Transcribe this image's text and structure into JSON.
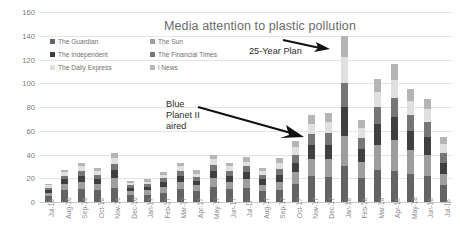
{
  "chart_data": {
    "type": "bar",
    "stacked": true,
    "title": "Media attention to plastic pollution",
    "xlabel": "",
    "ylabel": "",
    "ylim": [
      0,
      160
    ],
    "ytick_step": 20,
    "yticks": [
      0,
      20,
      40,
      60,
      80,
      100,
      120,
      140,
      160
    ],
    "grid": true,
    "legend_position": "top-left",
    "categories": [
      "Jul-16",
      "Aug-16",
      "Sep-16",
      "Oct-16",
      "Nov-16",
      "Dec-16",
      "Jan-17",
      "Feb-17",
      "Mar-17",
      "Apr-17",
      "May-17",
      "Jun-17",
      "Jul-17",
      "Aug-17",
      "Sep-17",
      "Oct-17",
      "Nov-17",
      "Dec-17",
      "Jan-18",
      "Feb-18",
      "Mar-18",
      "Apr-18",
      "May-18",
      "Jun-18",
      "Jul-18"
    ],
    "series": [
      {
        "name": "The Guardian",
        "color": "#636363",
        "values": [
          5,
          10,
          11,
          10,
          12,
          6,
          6,
          8,
          11,
          9,
          13,
          11,
          12,
          9,
          10,
          15,
          22,
          21,
          30,
          20,
          27,
          26,
          24,
          22,
          14
        ]
      },
      {
        "name": "The Sun",
        "color": "#9e9e9e",
        "values": [
          3,
          5,
          6,
          5,
          8,
          3,
          4,
          5,
          6,
          5,
          7,
          6,
          7,
          5,
          7,
          10,
          14,
          15,
          26,
          14,
          21,
          26,
          20,
          18,
          10
        ]
      },
      {
        "name": "The Independent",
        "color": "#3f3f3f",
        "values": [
          2,
          4,
          5,
          4,
          7,
          3,
          3,
          4,
          5,
          4,
          6,
          5,
          6,
          5,
          6,
          8,
          12,
          12,
          24,
          11,
          18,
          20,
          16,
          15,
          9
        ]
      },
      {
        "name": "The Financial Times",
        "color": "#767676",
        "values": [
          2,
          3,
          4,
          4,
          5,
          2,
          2,
          3,
          4,
          3,
          5,
          4,
          5,
          4,
          5,
          7,
          9,
          10,
          20,
          9,
          14,
          16,
          13,
          12,
          8
        ]
      },
      {
        "name": "The Daily Express",
        "color": "#e0e0e0",
        "values": [
          2,
          3,
          4,
          3,
          5,
          2,
          2,
          3,
          4,
          3,
          5,
          4,
          4,
          3,
          5,
          6,
          9,
          9,
          22,
          8,
          13,
          15,
          12,
          11,
          8
        ]
      },
      {
        "name": "i News",
        "color": "#b5b5b5",
        "values": [
          1,
          2,
          3,
          3,
          4,
          2,
          2,
          2,
          3,
          3,
          4,
          3,
          4,
          3,
          4,
          5,
          7,
          8,
          18,
          7,
          11,
          13,
          10,
          9,
          6
        ]
      }
    ],
    "totals": [
      15,
      27,
      33,
      29,
      41,
      18,
      19,
      25,
      33,
      27,
      40,
      33,
      38,
      29,
      37,
      51,
      73,
      75,
      140,
      69,
      104,
      116,
      95,
      87,
      55
    ],
    "annotations": [
      {
        "name": "blue-planet-annotation",
        "text": "Blue\nPlanet II\naired",
        "arrow": "points-right-down to Dec-17 column"
      },
      {
        "name": "25-year-plan-annotation",
        "text": "25-Year Plan",
        "arrow": "points-right to Jan-18 column"
      }
    ]
  }
}
